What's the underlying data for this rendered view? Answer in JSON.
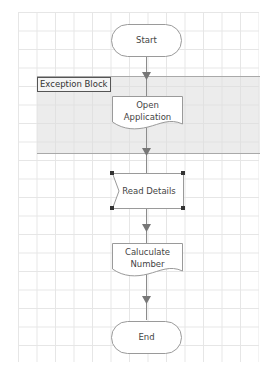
{
  "diagram": {
    "type": "flowchart",
    "exception_block": {
      "label": "Exception Block"
    },
    "nodes": [
      {
        "id": "start",
        "shape": "terminator",
        "label": "Start"
      },
      {
        "id": "open",
        "shape": "document",
        "label_line1": "Open",
        "label_line2": "Application"
      },
      {
        "id": "read",
        "shape": "manual-input",
        "label": "Read Details",
        "selected": true
      },
      {
        "id": "calc",
        "shape": "document",
        "label_line1": "Caluculate",
        "label_line2": "Number"
      },
      {
        "id": "end",
        "shape": "terminator",
        "label": "End"
      }
    ],
    "edges": [
      {
        "from": "start",
        "to": "open"
      },
      {
        "from": "open",
        "to": "read"
      },
      {
        "from": "read",
        "to": "calc"
      },
      {
        "from": "calc",
        "to": "end"
      }
    ],
    "colors": {
      "grid": "#e6e6e6",
      "band": "#dcdcdc",
      "stroke": "#8c8c8c",
      "arrow": "#777777",
      "handle": "#333333"
    }
  }
}
